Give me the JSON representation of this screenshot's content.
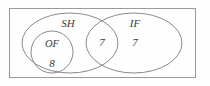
{
  "diagram": {
    "type": "venn-diagram",
    "universe": {
      "name": "universal-set-rectangle",
      "x": 9,
      "y": 8,
      "width": 187,
      "height": 70
    },
    "sets": [
      {
        "id": "sh",
        "label": "SH",
        "label_x": 68,
        "label_y": 24,
        "cx": 70,
        "cy": 43,
        "rx": 48,
        "ry": 30
      },
      {
        "id": "if",
        "label": "IF",
        "label_x": 135,
        "label_y": 24,
        "cx": 134,
        "cy": 43,
        "rx": 48,
        "ry": 30
      }
    ],
    "subsets": [
      {
        "id": "of",
        "label": "OF",
        "label_x": 52,
        "label_y": 45,
        "cx": 52,
        "cy": 52,
        "rx": 21,
        "ry": 21
      }
    ],
    "values": [
      {
        "id": "of-count",
        "region": "OF",
        "value": "8",
        "x": 52,
        "y": 64
      },
      {
        "id": "intersection-count",
        "region": "SH ∩ IF",
        "value": "7",
        "x": 102,
        "y": 43
      },
      {
        "id": "if-only-count",
        "region": "IF only",
        "value": "7",
        "x": 135,
        "y": 43
      }
    ],
    "colors": {
      "background": "#fefefe",
      "stroke": "#8a8a8a",
      "universe_stroke": "#9a9a9a",
      "text": "#3a3a3a"
    }
  }
}
